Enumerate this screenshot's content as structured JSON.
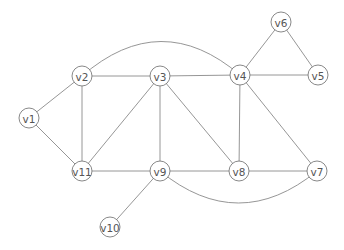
{
  "diagram": {
    "type": "undirected-graph",
    "node_radius": 10,
    "nodes": [
      {
        "id": "v1",
        "label": "v1",
        "x": 29,
        "y": 118
      },
      {
        "id": "v2",
        "label": "v2",
        "x": 82,
        "y": 76
      },
      {
        "id": "v3",
        "label": "v3",
        "x": 160,
        "y": 76
      },
      {
        "id": "v4",
        "label": "v4",
        "x": 240,
        "y": 75
      },
      {
        "id": "v5",
        "label": "v5",
        "x": 318,
        "y": 75
      },
      {
        "id": "v6",
        "label": "v6",
        "x": 281,
        "y": 22
      },
      {
        "id": "v7",
        "label": "v7",
        "x": 317,
        "y": 171
      },
      {
        "id": "v8",
        "label": "v8",
        "x": 239,
        "y": 171
      },
      {
        "id": "v9",
        "label": "v9",
        "x": 160,
        "y": 171
      },
      {
        "id": "v10",
        "label": "v10",
        "x": 110,
        "y": 227
      },
      {
        "id": "v11",
        "label": "v11",
        "x": 82,
        "y": 171
      }
    ],
    "edges": [
      {
        "from": "v1",
        "to": "v2",
        "curve": 0
      },
      {
        "from": "v1",
        "to": "v11",
        "curve": 0
      },
      {
        "from": "v2",
        "to": "v3",
        "curve": 0
      },
      {
        "from": "v2",
        "to": "v11",
        "curve": 0
      },
      {
        "from": "v2",
        "to": "v4",
        "curve": -34
      },
      {
        "from": "v3",
        "to": "v4",
        "curve": 0
      },
      {
        "from": "v3",
        "to": "v11",
        "curve": 0
      },
      {
        "from": "v3",
        "to": "v9",
        "curve": 0
      },
      {
        "from": "v3",
        "to": "v8",
        "curve": 0
      },
      {
        "from": "v4",
        "to": "v6",
        "curve": 0
      },
      {
        "from": "v4",
        "to": "v5",
        "curve": 0
      },
      {
        "from": "v5",
        "to": "v6",
        "curve": 0
      },
      {
        "from": "v4",
        "to": "v8",
        "curve": 0
      },
      {
        "from": "v4",
        "to": "v7",
        "curve": 0
      },
      {
        "from": "v11",
        "to": "v9",
        "curve": 0
      },
      {
        "from": "v9",
        "to": "v8",
        "curve": 0
      },
      {
        "from": "v8",
        "to": "v7",
        "curve": 0
      },
      {
        "from": "v9",
        "to": "v7",
        "curve": 32
      },
      {
        "from": "v9",
        "to": "v10",
        "curve": 0
      }
    ]
  }
}
